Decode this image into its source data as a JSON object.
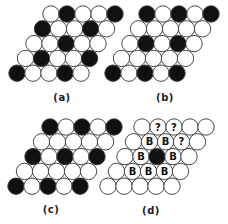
{
  "figure": {
    "colors": {
      "black": "#111111",
      "white": "#ffffff",
      "stroke": "#333333",
      "label_text": "#222222"
    },
    "geometry": {
      "spacing": 16,
      "row_height": 14.8,
      "row_shift": 8.5,
      "radius": 8.2
    },
    "panels": [
      {
        "id": "a",
        "label": "(a)",
        "label_pos": [
          62,
          92
        ],
        "origin": [
          51,
          14
        ],
        "rows": [
          [
            "W",
            "B",
            "W",
            "W",
            "B"
          ],
          [
            "B",
            "W",
            "W",
            "B",
            "W"
          ],
          [
            "W",
            "W",
            "B",
            "W",
            "W"
          ],
          [
            "W",
            "B",
            "W",
            "W",
            "B"
          ],
          [
            "B",
            "W",
            "W",
            "B",
            "W"
          ]
        ]
      },
      {
        "id": "b",
        "label": "(b)",
        "label_pos": [
          165,
          92
        ],
        "origin": [
          147,
          14
        ],
        "rows": [
          [
            "B",
            "W",
            "B",
            "W",
            "B"
          ],
          [
            "W",
            "W",
            "W",
            "W",
            "W"
          ],
          [
            "W",
            "B",
            "W",
            "B",
            "W"
          ],
          [
            "W",
            "W",
            "W",
            "W",
            "W"
          ],
          [
            "B",
            "W",
            "B",
            "W",
            "B"
          ]
        ]
      },
      {
        "id": "c",
        "label": "(c)",
        "label_pos": [
          51,
          204
        ],
        "origin": [
          50,
          127
        ],
        "rows": [
          [
            "B",
            "W",
            "B",
            "W",
            "B"
          ],
          [
            "W",
            "W",
            "W",
            "W",
            "W"
          ],
          [
            "B",
            "W",
            "B",
            "W",
            "B"
          ],
          [
            "W",
            "W",
            "W",
            "W",
            "W"
          ],
          [
            "B",
            "W",
            "B",
            "W",
            "B"
          ]
        ]
      },
      {
        "id": "d",
        "label": "(d)",
        "label_pos": [
          151,
          205
        ],
        "origin": [
          142,
          127
        ],
        "rows": [
          [
            "W",
            "?",
            "?",
            "W",
            "W"
          ],
          [
            "W",
            "B-label",
            "B-label",
            "?",
            "W"
          ],
          [
            "W",
            "B-label",
            "B",
            "B-label",
            "W"
          ],
          [
            "W",
            "B-label",
            "B-label",
            "B-label",
            "W"
          ],
          [
            "W",
            "W",
            "W",
            "W",
            "W"
          ]
        ],
        "legend": {
          "B-label": "white circle marked with letter B",
          "?": "white circle marked with question mark",
          "B": "black (filled) circle",
          "W": "white (empty) circle"
        },
        "marks": {
          "B-label": "B",
          "?": "?"
        }
      }
    ]
  }
}
